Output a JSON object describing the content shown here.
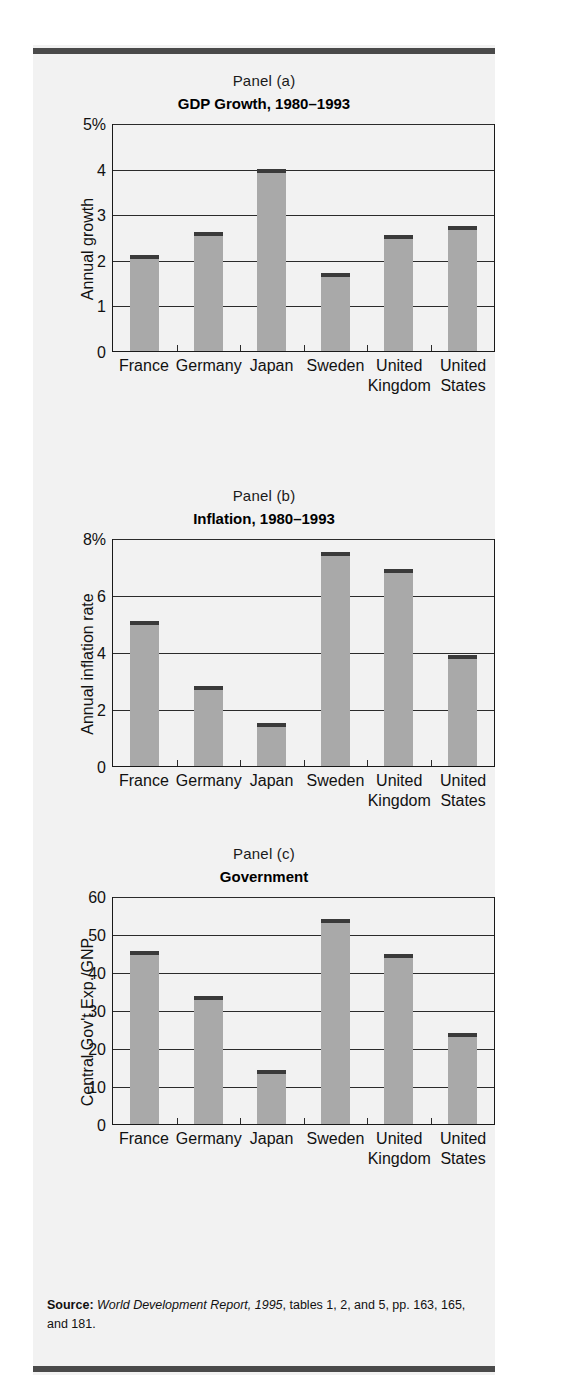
{
  "figure": {
    "source_prefix": "Source:",
    "source_italic": "World Development Report, 1995",
    "source_rest": ", tables 1, 2, and 5, pp. 163, 165, and 181.",
    "categories": [
      "France",
      "Germany",
      "Japan",
      "Sweden",
      "United Kingdom",
      "United States"
    ]
  },
  "chart_data": [
    {
      "type": "bar",
      "kicker": "Panel (a)",
      "title": "GDP Growth, 1980–1993",
      "categories": [
        "France",
        "Germany",
        "Japan",
        "Sweden",
        "United Kingdom",
        "United States"
      ],
      "values": [
        2.1,
        2.6,
        4.0,
        1.7,
        2.55,
        2.75
      ],
      "xlabel": "",
      "ylabel": "Annual growth",
      "ylim": [
        0,
        5
      ],
      "yticks": [
        0,
        1,
        2,
        3,
        4,
        5
      ],
      "ytick_labels": [
        "0",
        "1",
        "2",
        "3",
        "4",
        "5%"
      ],
      "grid": true,
      "legend": "none",
      "bar_color": "#a9a9a9",
      "bar_cap_color": "#3a3a3a"
    },
    {
      "type": "bar",
      "kicker": "Panel (b)",
      "title": "Inflation, 1980–1993",
      "categories": [
        "France",
        "Germany",
        "Japan",
        "Sweden",
        "United Kingdom",
        "United States"
      ],
      "values": [
        5.1,
        2.8,
        1.5,
        7.5,
        6.9,
        3.9
      ],
      "xlabel": "",
      "ylabel": "Annual inflation rate",
      "ylim": [
        0,
        8
      ],
      "yticks": [
        0,
        2,
        4,
        6,
        8
      ],
      "ytick_labels": [
        "0",
        "2",
        "4",
        "6",
        "8%"
      ],
      "grid": true,
      "legend": "none",
      "bar_color": "#a9a9a9",
      "bar_cap_color": "#3a3a3a"
    },
    {
      "type": "bar",
      "kicker": "Panel (c)",
      "title": "Government",
      "categories": [
        "France",
        "Germany",
        "Japan",
        "Sweden",
        "United Kingdom",
        "United States"
      ],
      "values": [
        45.5,
        33.8,
        14.2,
        54.0,
        44.7,
        24.0
      ],
      "xlabel": "",
      "ylabel": "Central Gov't Exp./GNP",
      "ylim": [
        0,
        60
      ],
      "yticks": [
        0,
        10,
        20,
        30,
        40,
        50,
        60
      ],
      "ytick_labels": [
        "0",
        "10",
        "20",
        "30",
        "40",
        "50",
        "60"
      ],
      "grid": true,
      "legend": "none",
      "bar_color": "#a9a9a9",
      "bar_cap_color": "#3a3a3a"
    }
  ]
}
